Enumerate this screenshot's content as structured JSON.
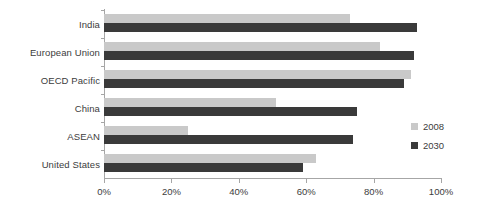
{
  "chart_data": {
    "type": "bar",
    "orientation": "horizontal",
    "title": "",
    "xlabel": "",
    "ylabel": "",
    "xlim": [
      0,
      100
    ],
    "xtick_labels": [
      "0%",
      "20%",
      "40%",
      "60%",
      "80%",
      "100%"
    ],
    "xtick_values": [
      0,
      20,
      40,
      60,
      80,
      100
    ],
    "grid": false,
    "legend_position": "right",
    "categories": [
      "India",
      "European Union",
      "OECD Pacific",
      "China",
      "ASEAN",
      "United States"
    ],
    "series": [
      {
        "name": "2008",
        "color": "#c9c9c9",
        "values": [
          73,
          82,
          91,
          51,
          25,
          63
        ]
      },
      {
        "name": "2030",
        "color": "#3a3a3a",
        "values": [
          93,
          92,
          89,
          75,
          74,
          59
        ]
      }
    ]
  },
  "legend": {
    "items": [
      {
        "label": "2008",
        "color": "#c9c9c9"
      },
      {
        "label": "2030",
        "color": "#3a3a3a"
      }
    ]
  }
}
